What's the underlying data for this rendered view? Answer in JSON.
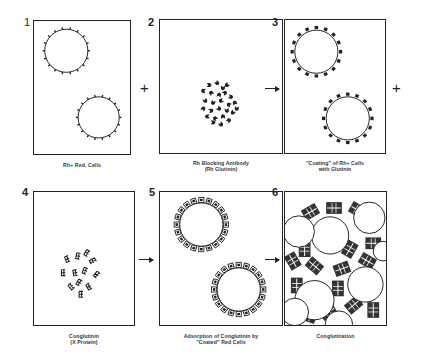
{
  "figure": {
    "panels": [
      {
        "number": "1",
        "caption_lines": [
          "Rh+  Red, Cells"
        ],
        "content": "two red cells with small antigen ticks"
      },
      {
        "number": "2",
        "caption_lines": [
          "Rh  Blocking  Antibody",
          "(Rh  Glutinin)"
        ],
        "content": "cluster of antibody molecules"
      },
      {
        "number": "3",
        "caption_lines": [
          "\"Coating\"  of  Rh+  Cells",
          "with  Glutinin"
        ],
        "content": "two cells coated with glutinin"
      },
      {
        "number": "4",
        "caption_lines": [
          "Conglutinin",
          "(X  Protein)"
        ],
        "content": "scattered conglutinin molecules"
      },
      {
        "number": "5",
        "caption_lines": [
          "Adsorption  of  Conglutinin  by",
          "\"Coated\"  Red  Cells"
        ],
        "content": "two coated cells with adsorbed conglutinin"
      },
      {
        "number": "6",
        "caption_lines": [
          "Conglutination"
        ],
        "content": "lattice of cells linked by conglutinin"
      }
    ],
    "operators": [
      {
        "symbol": "+",
        "between": "1-2"
      },
      {
        "symbol": "→",
        "between": "2-3"
      },
      {
        "symbol": "+",
        "after": "3"
      },
      {
        "symbol": "→",
        "between": "4-5"
      },
      {
        "symbol": "→",
        "between": "5-6"
      }
    ],
    "colors": {
      "ink": "#222222",
      "background": "#ffffff"
    }
  }
}
